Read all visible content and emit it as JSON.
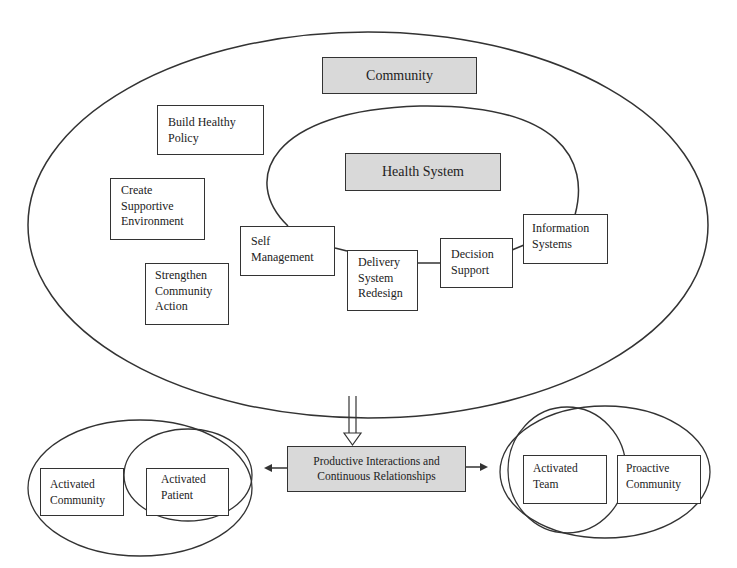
{
  "diagram": {
    "community_label": "Community",
    "health_system_label": "Health System",
    "community_boxes": [
      {
        "label": "Build Healthy\nPolicy"
      },
      {
        "label": "Create\nSupportive\nEnvironment"
      },
      {
        "label": "Strengthen\nCommunity\nAction"
      }
    ],
    "health_system_boxes": [
      {
        "label": "Self\nManagement"
      },
      {
        "label": "Delivery\nSystem\nRedesign"
      },
      {
        "label": "Decision\nSupport"
      },
      {
        "label": "Information\nSystems"
      }
    ],
    "outcome_label": "Productive Interactions and\nContinuous Relationships",
    "left_outcomes": [
      {
        "label": "Activated\nCommunity"
      },
      {
        "label": "Activated\nPatient"
      }
    ],
    "right_outcomes": [
      {
        "label": "Activated\nTeam"
      },
      {
        "label": "Proactive\nCommunity"
      }
    ],
    "colors": {
      "highlight_fill": "#d9d9d9",
      "stroke": "#333333"
    }
  }
}
